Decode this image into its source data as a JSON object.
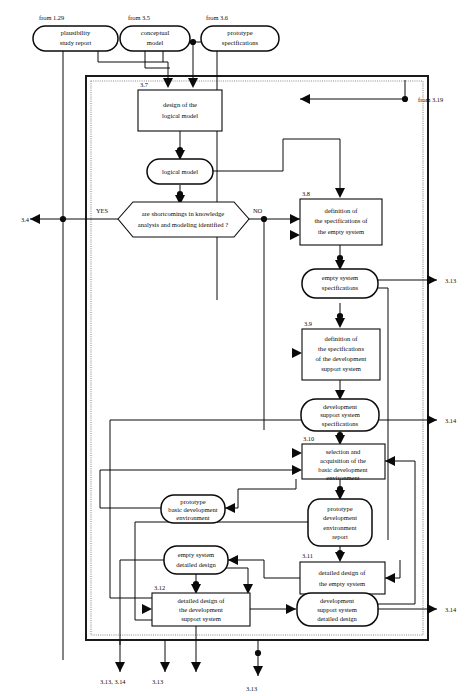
{
  "diagram": {
    "inputs": [
      {
        "id": "in1",
        "label": "from 1.29",
        "node": "plausibility\nstudy report"
      },
      {
        "id": "in2",
        "label": "from 3.5",
        "node": "conceptual\nmodel"
      },
      {
        "id": "in3",
        "label": "from 3.6",
        "node": "prototype\nspecifications"
      },
      {
        "id": "in4",
        "label": "from 3.19"
      }
    ],
    "steps": [
      {
        "num": "3.7",
        "label": "design of the\nlogical model"
      },
      {
        "num": "3.8",
        "label": "definition of\nthe specifications of\nthe empty system"
      },
      {
        "num": "3.9",
        "label": "definition of\nthe specifications\nof the development\nsupport system"
      },
      {
        "num": "3.10",
        "label": "selection and\nacquisition of the\nbasic development\nenvironment"
      },
      {
        "num": "3.11",
        "label": "detailed design of\nthe empty system"
      },
      {
        "num": "3.12",
        "label": "detailed design of\nthe development\nsupport system"
      }
    ],
    "artifacts": [
      {
        "id": "a1",
        "label": "logical model"
      },
      {
        "id": "a2",
        "label": "empty system\nspecifications"
      },
      {
        "id": "a3",
        "label": "development\nsupport system\nspecifications"
      },
      {
        "id": "a4",
        "label": "prototype\nbasic development\nenvironment"
      },
      {
        "id": "a5",
        "label": "prototype\ndevelopment\nenvironment\nreport"
      },
      {
        "id": "a6",
        "label": "empty system\ndetailed design"
      },
      {
        "id": "a7",
        "label": "development\nsupport system\ndetailed design"
      }
    ],
    "decision": {
      "label": "are shortcomings in knowledge\nanalysis and modeling identified ?",
      "yes": "YES",
      "no": "NO"
    },
    "outputs": [
      {
        "id": "o1",
        "label": "3.4"
      },
      {
        "id": "o2",
        "label": "3.13"
      },
      {
        "id": "o3",
        "label": "3.14"
      },
      {
        "id": "o4",
        "label": "3.14"
      },
      {
        "id": "o5",
        "label": "3.13, 3.14"
      },
      {
        "id": "o6",
        "label": "3.13"
      },
      {
        "id": "o7",
        "label": "3.13"
      }
    ],
    "colors": {
      "ink": "#0a0a0a",
      "paper": "#ffffff",
      "frame": "#1a1a1a",
      "frame_dotted": "#8a8a8a"
    }
  }
}
